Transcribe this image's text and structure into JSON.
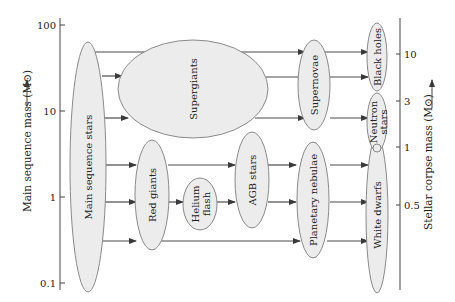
{
  "left_axis": {
    "label": "Main sequence mass (M⊙)",
    "ticks": [
      "100",
      "10",
      "1",
      "0.1"
    ]
  },
  "right_axis": {
    "label": "Stellar corpse mass (M⊙)",
    "ticks": [
      "10",
      "3",
      "1",
      "0.5"
    ]
  },
  "nodes": {
    "main_sequence": "Main sequence stars",
    "supergiants": "Supergiants",
    "red_giants": "Red giants",
    "helium_flash_1": "Helium",
    "helium_flash_2": "flash",
    "agb": "AGB stars",
    "supernovae": "Supernovae",
    "planetary_nebulae": "Planetary nebulae",
    "black_holes": "Black holes",
    "neutron_stars_1": "Neutron",
    "neutron_stars_2": "stars",
    "white_dwarfs": "White dwarfs"
  },
  "colors": {
    "node_fill": "#ececec",
    "node_stroke": "#8a8a8a",
    "arrow": "#4a4a4a"
  }
}
